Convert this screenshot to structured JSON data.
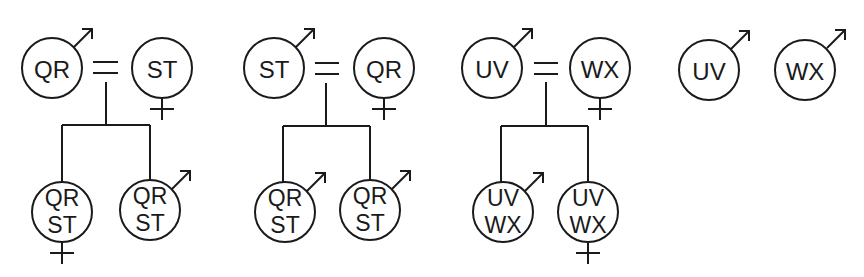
{
  "diagram": {
    "type": "pedigree",
    "colors": {
      "stroke": "#1a1a1a",
      "background": "#ffffff"
    },
    "groups": [
      {
        "parents": [
          {
            "label": "QR",
            "sex": "male",
            "icon": "male-symbol-icon"
          },
          {
            "label": "ST",
            "sex": "female",
            "icon": "female-symbol-icon"
          }
        ],
        "union_symbol": "=",
        "children": [
          {
            "line1": "QR",
            "line2": "ST",
            "sex": "female",
            "icon": "female-symbol-icon"
          },
          {
            "line1": "QR",
            "line2": "ST",
            "sex": "male",
            "icon": "male-symbol-icon"
          }
        ]
      },
      {
        "parents": [
          {
            "label": "ST",
            "sex": "male",
            "icon": "male-symbol-icon"
          },
          {
            "label": "QR",
            "sex": "female",
            "icon": "female-symbol-icon"
          }
        ],
        "union_symbol": "=",
        "children": [
          {
            "line1": "QR",
            "line2": "ST",
            "sex": "male",
            "icon": "male-symbol-icon"
          },
          {
            "line1": "QR",
            "line2": "ST",
            "sex": "male",
            "icon": "male-symbol-icon"
          }
        ]
      },
      {
        "parents": [
          {
            "label": "UV",
            "sex": "male",
            "icon": "male-symbol-icon"
          },
          {
            "label": "WX",
            "sex": "female",
            "icon": "female-symbol-icon"
          }
        ],
        "union_symbol": "=",
        "children": [
          {
            "line1": "UV",
            "line2": "WX",
            "sex": "male",
            "icon": "male-symbol-icon"
          },
          {
            "line1": "UV",
            "line2": "WX",
            "sex": "female",
            "icon": "female-symbol-icon"
          }
        ]
      },
      {
        "singles": [
          {
            "label": "UV",
            "sex": "male",
            "icon": "male-symbol-icon"
          },
          {
            "label": "WX",
            "sex": "male",
            "icon": "male-symbol-icon"
          }
        ]
      }
    ]
  }
}
